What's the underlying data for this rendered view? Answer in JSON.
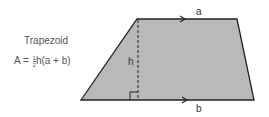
{
  "diagram": {
    "title": "Trapezoid",
    "formula": {
      "lhs": "A",
      "equals": "=",
      "frac_num": "1",
      "frac_den": "2",
      "rhs": "h(a + b)"
    },
    "labels": {
      "top_base": "a",
      "bottom_base": "b",
      "height": "h"
    },
    "colors": {
      "fill": "#b8b8b8",
      "stroke": "#222222",
      "text": "#555555"
    }
  }
}
